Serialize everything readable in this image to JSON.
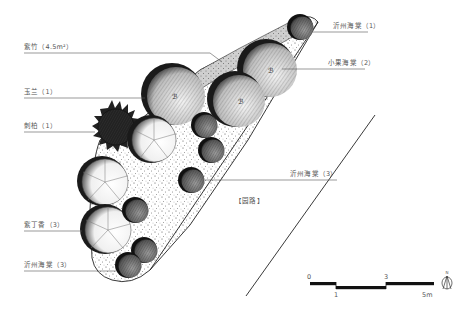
{
  "labels": {
    "bamboo": "紫竹（4.5m²）",
    "magnolia": "玉兰（1）",
    "juniper": "刺柏（1）",
    "crabapple_top": "沂州海棠（1）",
    "small_crabapple": "小果海棠（2）",
    "crabapple_mid": "沂州海棠（3）",
    "lilac": "紫丁香（3）",
    "crabapple_bottom": "沂州海棠（3）",
    "path": "【园路】"
  },
  "scale_bar": {
    "ticks": [
      "0",
      "1",
      "3",
      "5m"
    ],
    "unit": "m"
  },
  "north_arrow": {
    "letter": "N",
    "icon": "north-arrow-icon"
  },
  "plants": [
    {
      "name": "紫竹",
      "quantity": "4.5m²",
      "symbol": "grey-stippled-band"
    },
    {
      "name": "玉兰",
      "quantity": 1,
      "symbol": "large-hatched-circle"
    },
    {
      "name": "刺柏",
      "quantity": 1,
      "symbol": "spiky-dark-circle"
    },
    {
      "name": "沂州海棠",
      "quantity": 1,
      "symbol": "small-dark-circle"
    },
    {
      "name": "小果海棠",
      "quantity": 2,
      "symbol": "large-hatched-circle"
    },
    {
      "name": "沂州海棠",
      "quantity": 3,
      "symbol": "small-dark-circle"
    },
    {
      "name": "紫丁香",
      "quantity": 3,
      "symbol": "scalloped-light-circle"
    },
    {
      "name": "沂州海棠",
      "quantity": 3,
      "symbol": "small-dark-circle"
    }
  ]
}
